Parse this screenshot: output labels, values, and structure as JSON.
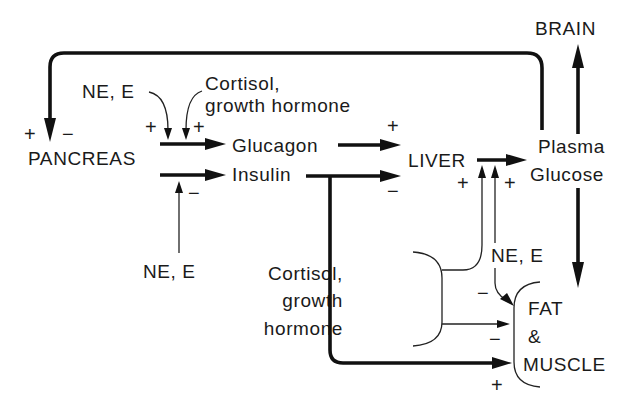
{
  "nodes": {
    "brain": "BRAIN",
    "pancreas": "PANCREAS",
    "glucagon": "Glucagon",
    "insulin": "Insulin",
    "liver": "LIVER",
    "plasma_glucose_line1": "Plasma",
    "plasma_glucose_line2": "Glucose",
    "fat_muscle_line1": "FAT",
    "fat_muscle_line2": "&",
    "fat_muscle_line3": "MUSCLE"
  },
  "regulators": {
    "ne_e_top": "NE, E",
    "cortisol_top_line1": "Cortisol,",
    "cortisol_top_line2": "growth hormone",
    "ne_e_bottom": "NE, E",
    "ne_e_right": "NE, E",
    "cortisol_bottom_line1": "Cortisol,",
    "cortisol_bottom_line2": "growth",
    "cortisol_bottom_line3": "hormone"
  },
  "signs": {
    "pancreas_feedback_plus": "+",
    "pancreas_feedback_minus": "−",
    "glucagon_ne_e": "+",
    "glucagon_cortisol": "+",
    "insulin_ne_e": "−",
    "glucagon_to_liver": "+",
    "insulin_to_liver": "−",
    "liver_cortisol": "+",
    "liver_ne_e": "+",
    "fat_ne_e": "−",
    "fat_cortisol": "−",
    "fat_insulin": "+"
  }
}
